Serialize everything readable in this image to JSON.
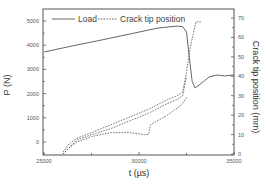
{
  "chart_data": {
    "type": "line",
    "title": "",
    "xlabel": "t (µs)",
    "ylabel": "P (N)",
    "y2label": "Crack tip position (mm)",
    "xlim": [
      25000,
      35000
    ],
    "ylim": [
      -600,
      5500
    ],
    "y2lim": [
      0,
      70
    ],
    "x_ticks": [
      25000,
      30000,
      35000
    ],
    "x_tick_labels": [
      "25000",
      "30000",
      "35000"
    ],
    "y_ticks": [
      0,
      1000,
      2000,
      3000,
      4000,
      5000
    ],
    "y_tick_labels": [
      "0",
      "1000",
      "2000",
      "3000",
      "4000",
      "5000"
    ],
    "y2_ticks": [
      0,
      10,
      20,
      30,
      40,
      50,
      60,
      70
    ],
    "y2_tick_labels": [
      "0",
      "10",
      "20",
      "30",
      "40",
      "50",
      "60",
      "70"
    ],
    "grid": false,
    "legend_position": "top-left inside",
    "legend": [
      {
        "label": "Load",
        "style": "solid"
      },
      {
        "label": "Crack tip position",
        "style": "dashed"
      }
    ],
    "series": [
      {
        "name": "Load",
        "axis": "left",
        "style": "solid",
        "x": [
          25000,
          26500,
          28000,
          29500,
          31000,
          32000,
          32300,
          32500,
          32650,
          32800,
          32950,
          33100,
          33400,
          33700,
          34100,
          34500,
          35000
        ],
        "y": [
          3720,
          3970,
          4210,
          4460,
          4710,
          4790,
          4770,
          4550,
          3500,
          2500,
          2230,
          2320,
          2500,
          2690,
          2770,
          2730,
          2770
        ]
      },
      {
        "name": "Crack tip position (run 1)",
        "axis": "right",
        "style": "dashed",
        "x": [
          26000,
          26300,
          26700,
          27500,
          28500,
          29500,
          30500,
          31500,
          32000,
          32300,
          32500,
          32700,
          33000,
          33300
        ],
        "y": [
          1,
          5,
          8,
          11,
          15,
          19,
          23,
          28,
          30,
          32,
          42,
          55,
          68,
          68
        ]
      },
      {
        "name": "Crack tip position (run 2)",
        "axis": "right",
        "style": "dashed",
        "x": [
          26000,
          26300,
          26700,
          27500,
          28500,
          29500,
          30500,
          31500,
          32000,
          32300,
          32500
        ],
        "y": [
          0,
          3,
          7,
          10,
          13,
          17,
          21,
          26,
          28,
          30,
          40
        ]
      },
      {
        "name": "Crack tip position (run 3)",
        "axis": "right",
        "style": "dashed",
        "x": [
          26000,
          26300,
          26700,
          27500,
          28500,
          29500,
          30300,
          30500,
          30600,
          31500,
          32200,
          32500
        ],
        "y": [
          0,
          3,
          6,
          9,
          11,
          11,
          10,
          10,
          15,
          20,
          25,
          29
        ]
      }
    ]
  }
}
